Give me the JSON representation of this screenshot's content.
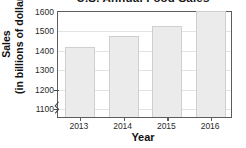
{
  "chart_data": {
    "type": "bar",
    "title": "U.S. Annual Food Sales",
    "xlabel": "Year",
    "ylabel_line1": "Sales",
    "ylabel_line2": "(in billions of dollars)",
    "categories": [
      "2013",
      "2014",
      "2015",
      "2016"
    ],
    "values": [
      1410,
      1465,
      1520,
      1595
    ],
    "ylim": [
      1050,
      1600
    ],
    "yticks": [
      "1100",
      "1200",
      "1300",
      "1400",
      "1500",
      "1600"
    ],
    "ytick_values": [
      1100,
      1200,
      1300,
      1400,
      1500,
      1600
    ],
    "grid": true,
    "legend": "none",
    "axis_break": true,
    "bar_fill_color": "#ebebeb",
    "bar_border_color": "#cfcfcf",
    "axis_color": "#5d5d5d",
    "grid_color": "#e3e3e3",
    "text_color": "#2a2a2a"
  }
}
